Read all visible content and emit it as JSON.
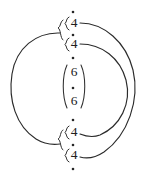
{
  "figure": {
    "background_color": "#ffffff",
    "stroke_color": "#2b2b2b",
    "width": 146,
    "height": 178,
    "nodes": [
      {
        "id": "dot-top",
        "symbol": "·",
        "kind": "dot",
        "x": 73,
        "y": 12
      },
      {
        "id": "numeral-1",
        "symbol": "4",
        "kind": "numeral",
        "x": 73,
        "y": 24
      },
      {
        "id": "dot-2",
        "symbol": "·",
        "kind": "dot",
        "x": 73,
        "y": 35
      },
      {
        "id": "numeral-2",
        "symbol": "4",
        "kind": "numeral",
        "x": 73,
        "y": 45
      },
      {
        "id": "dot-3",
        "symbol": "·",
        "kind": "dot",
        "x": 73,
        "y": 58
      },
      {
        "id": "numeral-3",
        "symbol": "6",
        "kind": "numeral",
        "x": 73,
        "y": 73
      },
      {
        "id": "dot-4",
        "symbol": "·",
        "kind": "dot",
        "x": 73,
        "y": 88
      },
      {
        "id": "numeral-4",
        "symbol": "6",
        "kind": "numeral",
        "x": 73,
        "y": 102
      },
      {
        "id": "dot-5",
        "symbol": "·",
        "kind": "dot",
        "x": 73,
        "y": 120
      },
      {
        "id": "numeral-5",
        "symbol": "4",
        "kind": "numeral",
        "x": 73,
        "y": 133
      },
      {
        "id": "dot-6",
        "symbol": "·",
        "kind": "dot",
        "x": 73,
        "y": 145
      },
      {
        "id": "numeral-6",
        "symbol": "4",
        "kind": "numeral",
        "x": 73,
        "y": 156
      },
      {
        "id": "dot-bottom",
        "symbol": "·",
        "kind": "dot",
        "x": 73,
        "y": 169
      }
    ],
    "groupings": [
      {
        "id": "brace-top",
        "type": "curly-brace",
        "orientation": "left",
        "members": [
          "numeral-1",
          "numeral-2"
        ]
      },
      {
        "id": "brace-top-inner",
        "type": "curly-brace",
        "orientation": "right",
        "members": [
          "numeral-1"
        ]
      },
      {
        "id": "brace-top-inner2",
        "type": "curly-brace",
        "orientation": "right",
        "members": [
          "numeral-2"
        ]
      },
      {
        "id": "paren-middle",
        "type": "parenthesis",
        "orientation": "both",
        "members": [
          "numeral-3",
          "numeral-4"
        ]
      },
      {
        "id": "brace-bottom",
        "type": "curly-brace",
        "orientation": "left",
        "members": [
          "numeral-5",
          "numeral-6"
        ]
      },
      {
        "id": "brace-bot-inner",
        "type": "curly-brace",
        "orientation": "right",
        "members": [
          "numeral-5"
        ]
      },
      {
        "id": "brace-bot-inner2",
        "type": "curly-brace",
        "orientation": "right",
        "members": [
          "numeral-6"
        ]
      }
    ],
    "arcs": [
      {
        "id": "arc-left-outer",
        "side": "left",
        "from": "brace-top",
        "to": "brace-bottom"
      },
      {
        "id": "arc-right-outer",
        "side": "right",
        "from": "numeral-1",
        "to": "numeral-6"
      },
      {
        "id": "arc-right-inner",
        "side": "right",
        "from": "numeral-2",
        "to": "numeral-5"
      }
    ],
    "crossing_points": [
      {
        "id": "crossing-right",
        "x": 128,
        "y": 88
      }
    ]
  }
}
